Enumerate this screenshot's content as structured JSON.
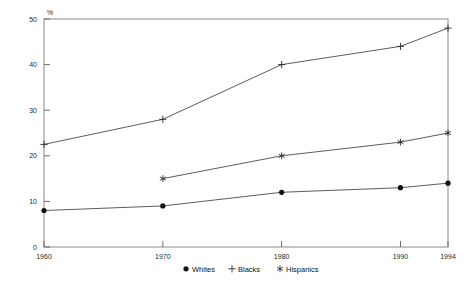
{
  "chart_data": {
    "type": "line",
    "title": "",
    "xlabel": "",
    "ylabel": "%",
    "categories": [
      "1960",
      "1970",
      "1980",
      "1990",
      "1994"
    ],
    "x": [
      1960,
      1970,
      1980,
      1990,
      1994
    ],
    "xlim": [
      1960,
      1994
    ],
    "ylim": [
      0,
      50
    ],
    "yticks": [
      "0",
      "10",
      "20",
      "30",
      "40",
      "50"
    ],
    "ytick_values": [
      0,
      10,
      20,
      30,
      40,
      50
    ],
    "xticks": [
      "1960",
      "1970",
      "1980",
      "1990",
      "1994"
    ],
    "grid": false,
    "legend_position": "bottom-center",
    "series": [
      {
        "name": "Whites",
        "marker": "filled-circle",
        "values": [
          8,
          9,
          12,
          13,
          14
        ],
        "x": [
          1960,
          1970,
          1980,
          1990,
          1994
        ]
      },
      {
        "name": "Blacks",
        "marker": "plus",
        "values": [
          22.5,
          28,
          40,
          44,
          48
        ],
        "x": [
          1960,
          1970,
          1980,
          1990,
          1994
        ]
      },
      {
        "name": "Hispanics",
        "marker": "asterisk",
        "values": [
          15,
          20,
          23,
          25
        ],
        "x": [
          1970,
          1980,
          1990,
          1994
        ]
      }
    ]
  },
  "axis": {
    "unit_label": "%"
  },
  "legend": {
    "entries": [
      {
        "label": "Whites",
        "marker": "filled-circle"
      },
      {
        "label": "Blacks",
        "marker": "plus"
      },
      {
        "label": "Hispanics",
        "marker": "asterisk"
      }
    ]
  },
  "colors": {
    "axis": "#8a8a8a",
    "line": "#4a4a4a",
    "marker": "#2b2b2b",
    "text": "#1a1a1a",
    "background": "#ffffff"
  }
}
